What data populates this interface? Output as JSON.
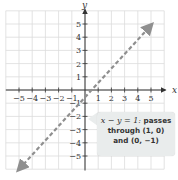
{
  "chart_data": {
    "type": "line",
    "title": "",
    "xlabel": "x",
    "ylabel": "y",
    "xlim": [
      -6,
      6
    ],
    "ylim": [
      -6,
      6
    ],
    "grid": true,
    "x_ticks": [
      -5,
      -4,
      -3,
      -2,
      -1,
      1,
      2,
      3,
      4,
      5
    ],
    "y_ticks": [
      5,
      4,
      3,
      2,
      1,
      -1,
      -2,
      -3,
      -4,
      -5
    ],
    "x_tick_labels": [
      "−5",
      "−4",
      "−3",
      "−2",
      "−1",
      "1",
      "2",
      "3",
      "4",
      "5"
    ],
    "y_tick_labels": [
      "5",
      "4",
      "3",
      "2",
      "1",
      "−1",
      "−2",
      "−3",
      "−4",
      "−5"
    ],
    "series": [
      {
        "name": "x - y = 1",
        "style": "dashed",
        "color": "#8f8f8f",
        "arrows": "both",
        "x": [
          -5,
          5
        ],
        "y": [
          -6,
          4.9
        ]
      }
    ],
    "key_points": [
      [
        1,
        0
      ],
      [
        0,
        -1
      ]
    ],
    "annotation": {
      "equation": "x − y = 1:",
      "text_line1": "passes",
      "text_line2": "through (1, 0)",
      "text_line3": "and (0, −1)"
    }
  },
  "axes": {
    "x_label": "x",
    "y_label": "y"
  },
  "colors": {
    "grid": "#dcdcdc",
    "axis": "#333333",
    "line": "#8f8f8f",
    "callout_bg": "#e9ecec"
  }
}
